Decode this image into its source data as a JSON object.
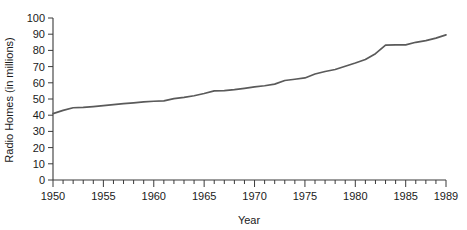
{
  "chart_data": {
    "type": "line",
    "title": "",
    "subtitle": "",
    "xlabel": "Year",
    "ylabel": "Radio Homes (in millions)",
    "xlim": [
      1950,
      1989
    ],
    "ylim": [
      0,
      100
    ],
    "grid": false,
    "legend": false,
    "legend_position": "none",
    "y_ticks": [
      0,
      10,
      20,
      30,
      40,
      50,
      60,
      70,
      80,
      90,
      100
    ],
    "y_tick_labels": [
      "0",
      "10",
      "20",
      "30",
      "40",
      "50",
      "60",
      "70",
      "80",
      "90",
      "100"
    ],
    "y_tick_interval": 10,
    "x_ticks_major": [
      1950,
      1955,
      1960,
      1965,
      1970,
      1975,
      1980,
      1985,
      1989
    ],
    "x_tick_labels": [
      "1950",
      "1955",
      "1960",
      "1965",
      "1970",
      "1975",
      "1980",
      "1985",
      "1989"
    ],
    "x_minor_tick_interval": 1,
    "series": [
      {
        "name": "Radio Homes",
        "color": "#5a5a5a",
        "x": [
          1950,
          1951,
          1952,
          1953,
          1954,
          1955,
          1956,
          1957,
          1958,
          1959,
          1960,
          1961,
          1962,
          1963,
          1964,
          1965,
          1966,
          1967,
          1968,
          1969,
          1970,
          1971,
          1972,
          1973,
          1974,
          1975,
          1976,
          1977,
          1978,
          1979,
          1980,
          1981,
          1982,
          1983,
          1984,
          1985,
          1986,
          1987,
          1988,
          1989
        ],
        "values": [
          41.0,
          43.0,
          44.6,
          44.8,
          45.3,
          45.9,
          46.5,
          47.1,
          47.6,
          48.2,
          48.6,
          48.8,
          50.2,
          51.0,
          52.0,
          53.4,
          55.0,
          55.2,
          55.8,
          56.6,
          57.5,
          58.2,
          59.2,
          61.4,
          62.2,
          63.0,
          65.4,
          67.0,
          68.2,
          70.2,
          72.2,
          74.4,
          78.0,
          83.2,
          83.4,
          83.4,
          85.0,
          86.0,
          87.6,
          89.6
        ]
      }
    ]
  },
  "axes": {
    "y_axis_title": "Radio Homes (in millions)",
    "x_axis_title": "Year"
  }
}
